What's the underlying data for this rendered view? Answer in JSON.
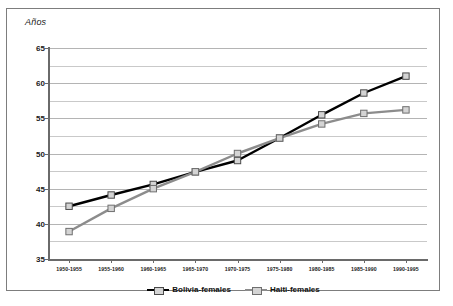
{
  "chart_data": {
    "type": "line",
    "title": "",
    "xlabel": "",
    "ylabel": "Años",
    "ylim": [
      35,
      65
    ],
    "yticks": [
      35,
      40,
      45,
      50,
      55,
      60,
      65
    ],
    "grid": true,
    "legend_position": "bottom",
    "categories": [
      "1950-1955",
      "1955-1960",
      "1960-1965",
      "1965-1970",
      "1970-1975",
      "1975-1980",
      "1980-1985",
      "1985-1990",
      "1990-1995"
    ],
    "series": [
      {
        "name": "Bolivia-females",
        "color": "#000000",
        "marker": "square",
        "values": [
          42.5,
          44.1,
          45.6,
          47.4,
          49.0,
          52.2,
          55.5,
          58.6,
          61.0
        ]
      },
      {
        "name": "Haiti-females",
        "color": "#8c8c8c",
        "marker": "square",
        "values": [
          38.9,
          42.2,
          45.0,
          47.4,
          50.0,
          52.2,
          54.2,
          55.7,
          56.2
        ]
      }
    ]
  },
  "axis": {
    "y_label": "Años",
    "y_tick_labels": [
      "65",
      "60",
      "55",
      "50",
      "45",
      "40",
      "35"
    ],
    "x_tick_labels": [
      "1950-1955",
      "1955-1960",
      "1960-1965",
      "1965-1970",
      "1970-1975",
      "1975-1980",
      "1980-1985",
      "1985-1990",
      "1990-1995"
    ]
  },
  "legend": {
    "items": [
      {
        "label": "Bolivia-females",
        "color": "#000000"
      },
      {
        "label": "Haiti-females",
        "color": "#8c8c8c"
      }
    ]
  },
  "colors": {
    "series_1": "#000000",
    "series_2": "#8c8c8c",
    "grid": "#c9c9c9",
    "axis": "#6a6a6a",
    "frame": "#7d7d7d",
    "marker_fill": "#d4d4d4"
  }
}
